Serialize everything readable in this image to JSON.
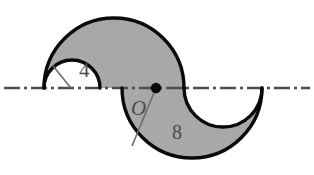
{
  "figure": {
    "labels": {
      "small_radius": "4",
      "large_radius": "8",
      "center_point": "O"
    },
    "colors": {
      "fill": "#a8a8a8",
      "outline": "#000000",
      "background": "#ffffff",
      "axis_line": "#4d4d4d",
      "label_text": "#4a4a4a",
      "leader_line": "#6b6b6b"
    },
    "geometry": {
      "axis_y": 88,
      "center_O": {
        "x": 156,
        "y": 88
      },
      "upper_large_arc": {
        "cx": 114,
        "cy": 88,
        "r": 70
      },
      "upper_small_arc": {
        "cx": 72,
        "cy": 88,
        "r": 28
      },
      "lower_large_arc": {
        "cx": 192,
        "cy": 88,
        "r": 70
      },
      "lower_small_arc": {
        "cx": 223,
        "cy": 88,
        "r": 39
      }
    },
    "label_positions": {
      "small_radius": {
        "x": 79,
        "y": 77
      },
      "large_radius": {
        "x": 172,
        "y": 139
      },
      "center_point": {
        "x": 131,
        "y": 115
      }
    },
    "leader_lines": {
      "small_radius": {
        "x1": 71,
        "y1": 88,
        "x2": 53,
        "y2": 66
      },
      "large_radius": {
        "x1": 156,
        "y1": 88,
        "x2": 132,
        "y2": 146
      }
    }
  }
}
